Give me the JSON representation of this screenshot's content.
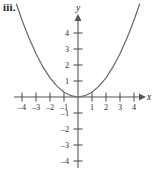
{
  "figure": {
    "label": "iii.",
    "x_axis_label": "x",
    "y_axis_label": "y"
  },
  "chart_data": {
    "type": "line",
    "title": "",
    "subtitle": "",
    "annotations": [
      "iii."
    ],
    "xlabel": "x",
    "ylabel": "y",
    "xlim": [
      -4.7,
      4.7
    ],
    "ylim": [
      -4.7,
      4.9
    ],
    "grid": false,
    "legend": null,
    "axes_style": "cartesian-arrows",
    "xticks": [
      -4,
      -3,
      -2,
      -1,
      1,
      2,
      3,
      4
    ],
    "yticks": [
      -4,
      -3,
      -2,
      -1,
      1,
      2,
      3,
      4
    ],
    "xtick_labels": [
      "–4",
      "–3",
      "–2",
      "–1",
      "1",
      "2",
      "3",
      "4"
    ],
    "ytick_labels": [
      "–4",
      "–3",
      "–2",
      "–1",
      "1",
      "2",
      "3",
      "4"
    ],
    "series": [
      {
        "name": "parabola",
        "equation": "y = 0.3x^2",
        "color": "#6b6b6b",
        "x": [
          -4.4,
          -4.0,
          -3.5,
          -3.0,
          -2.5,
          -2.0,
          -1.5,
          -1.0,
          -0.5,
          0.0,
          0.5,
          1.0,
          1.5,
          2.0,
          2.5,
          3.0,
          3.5,
          4.0,
          4.4
        ],
        "values": [
          5.81,
          4.8,
          3.68,
          2.7,
          1.88,
          1.2,
          0.68,
          0.3,
          0.08,
          0.0,
          0.08,
          0.3,
          0.68,
          1.2,
          1.88,
          2.7,
          3.68,
          4.8,
          5.81
        ]
      }
    ]
  }
}
